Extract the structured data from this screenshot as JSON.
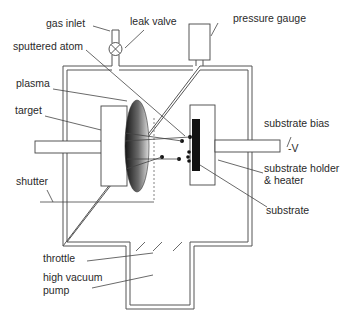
{
  "diagram": {
    "labels": {
      "gas_inlet": "gas inlet",
      "leak_valve": "leak valve",
      "pressure_gauge": "pressure gauge",
      "sputtered_atom": "sputtered atom",
      "plasma": "plasma",
      "target": "target",
      "substrate_bias": "substrate bias",
      "bias_value": "-V",
      "substrate_holder_line1": "substrate holder",
      "substrate_holder_line2": "& heater",
      "shutter": "shutter",
      "substrate": "substrate",
      "throttle": "throttle",
      "pump_line1": "high vacuum",
      "pump_line2": "pump"
    },
    "colors": {
      "line": "#444444",
      "substrate": "#111111",
      "plasma_dark": "#1a1a1a",
      "plasma_light": "#d8d8d8"
    }
  }
}
